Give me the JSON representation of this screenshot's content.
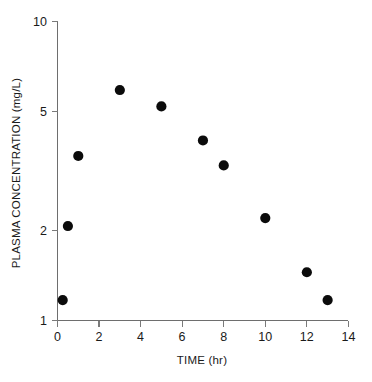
{
  "chart_data": {
    "type": "scatter",
    "title": "",
    "xlabel": "TIME (hr)",
    "ylabel": "PLASMA CONCENTRATION (mg/L)",
    "yscale": "log",
    "xscale": "linear",
    "xlim": [
      0,
      14
    ],
    "ylim": [
      1,
      10
    ],
    "grid": false,
    "legend": null,
    "xticks": [
      0,
      2,
      4,
      6,
      8,
      10,
      12,
      14
    ],
    "xtick_labels": [
      "0",
      "2",
      "4",
      "6",
      "8",
      "10",
      "12",
      "14"
    ],
    "yticks": [
      1,
      2,
      5,
      10
    ],
    "ytick_labels": [
      "1",
      "2",
      "5",
      "10"
    ],
    "series": [
      {
        "name": "plasma concentration",
        "marker": "filled-circle",
        "color": "#0b0b0b",
        "x": [
          0.25,
          0.5,
          1,
          3,
          5,
          7,
          8,
          10,
          12,
          13
        ],
        "y": [
          1.17,
          2.07,
          3.55,
          5.9,
          5.2,
          4.0,
          3.3,
          2.2,
          1.45,
          1.17
        ]
      }
    ]
  },
  "axes": {
    "y_title": "PLASMA CONCENTRATION (mg/L)",
    "x_title": "TIME (hr)"
  }
}
